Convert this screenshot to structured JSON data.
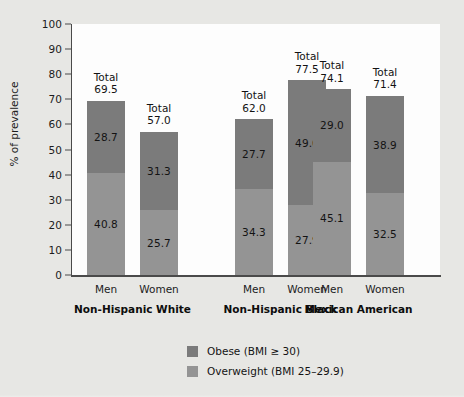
{
  "chart_data": {
    "type": "bar",
    "subtype": "stacked",
    "title": "",
    "xlabel": "",
    "ylabel": "% of prevalence",
    "ylim": [
      0,
      100
    ],
    "ytick_values": [
      0,
      10,
      20,
      30,
      40,
      50,
      60,
      70,
      80,
      90,
      100
    ],
    "ytick_labels": [
      "0",
      "10",
      "20",
      "30",
      "40",
      "50",
      "60",
      "70",
      "80",
      "90",
      "100"
    ],
    "grid": false,
    "legend_position": "bottom-center",
    "groups": [
      {
        "name": "Non-Hispanic White",
        "bars": [
          {
            "category": "Men",
            "total": "69.5",
            "obese": "28.7",
            "overweight": "40.8",
            "total_value": 69.5,
            "obese_value": 28.7,
            "overweight_value": 40.8
          },
          {
            "category": "Women",
            "total": "57.0",
            "obese": "31.3",
            "overweight": "25.7",
            "total_value": 57.0,
            "obese_value": 31.3,
            "overweight_value": 25.7
          }
        ]
      },
      {
        "name": "Non-Hispanic Black",
        "bars": [
          {
            "category": "Men",
            "total": "62.0",
            "obese": "27.7",
            "overweight": "34.3",
            "total_value": 62.0,
            "obese_value": 27.7,
            "overweight_value": 34.3
          },
          {
            "category": "Women",
            "total": "77.5",
            "obese": "49.6",
            "overweight": "27.9",
            "total_value": 77.5,
            "obese_value": 49.6,
            "overweight_value": 27.9
          }
        ]
      },
      {
        "name": "Mexican American",
        "bars": [
          {
            "category": "Men",
            "total": "74.1",
            "obese": "29.0",
            "overweight": "45.1",
            "total_value": 74.1,
            "obese_value": 29.0,
            "overweight_value": 45.1
          },
          {
            "category": "Women",
            "total": "71.4",
            "obese": "38.9",
            "overweight": "32.5",
            "total_value": 71.4,
            "obese_value": 38.9,
            "overweight_value": 32.5
          }
        ]
      }
    ],
    "categories": [
      "Non-Hispanic White Men",
      "Non-Hispanic White Women",
      "Non-Hispanic Black Men",
      "Non-Hispanic Black Women",
      "Mexican American Men",
      "Mexican American Women"
    ],
    "series": [
      {
        "name": "Obese (BMI ≥ 30)",
        "values": [
          28.7,
          31.3,
          27.7,
          49.6,
          29.0,
          38.9
        ],
        "color": "#7b7b7b"
      },
      {
        "name": "Overweight (BMI 25–29.9)",
        "values": [
          40.8,
          25.7,
          34.3,
          27.9,
          45.1,
          32.5
        ],
        "color": "#949494"
      }
    ],
    "totals": [
      69.5,
      57.0,
      62.0,
      77.5,
      74.1,
      71.4
    ],
    "total_prefix": "Total"
  },
  "legend": {
    "items": [
      {
        "label": "Obese (BMI ≥ 30)",
        "color": "#7b7b7b"
      },
      {
        "label": "Overweight (BMI 25–29.9)",
        "color": "#949494"
      }
    ]
  },
  "colors": {
    "obese": "#7b7b7b",
    "overweight": "#949494",
    "page_background": "#e7e7e4",
    "plot_background": "#fdfdfd",
    "axis": "#4a4a4a",
    "text": "#1c1c1c"
  }
}
